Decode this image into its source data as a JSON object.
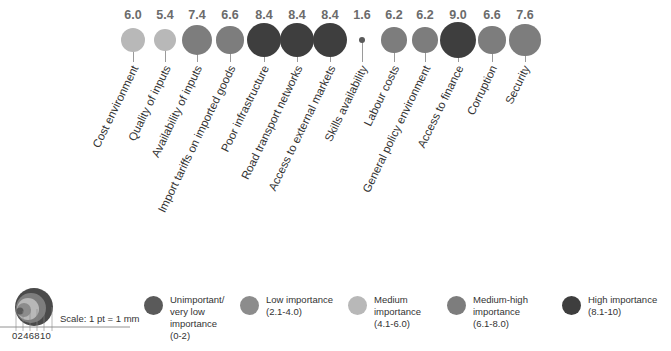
{
  "chart_data": {
    "type": "bubble",
    "title": "",
    "categories": [
      "Cost environment",
      "Quality of inputs",
      "Availability of inputs",
      "Import tariffs on imported goods",
      "Poor infrastructure",
      "Road transport networks",
      "Access to external markets",
      "Skills availability",
      "Labour costs",
      "General policy environment",
      "Access to finance",
      "Corruption",
      "Security"
    ],
    "values": [
      6.0,
      5.4,
      7.4,
      6.6,
      8.4,
      8.4,
      8.4,
      1.6,
      6.2,
      6.2,
      9.0,
      6.6,
      7.6
    ],
    "value_labels": [
      "6.0",
      "5.4",
      "7.4",
      "6.6",
      "8.4",
      "8.4",
      "8.4",
      "1.6",
      "6.2",
      "6.2",
      "9.0",
      "6.6",
      "7.6"
    ],
    "importance_class": [
      "medium",
      "medium",
      "medium-high",
      "medium-high",
      "high",
      "high",
      "high",
      "unimportant",
      "medium-high",
      "medium-high",
      "high",
      "medium-high",
      "medium-high"
    ],
    "legend": [
      {
        "key": "unimportant",
        "label": "Unimportant/\nvery low\nimportance\n(0-2)",
        "color": "#5a5a5a"
      },
      {
        "key": "low",
        "label": "Low importance\n(2.1-4.0)",
        "color": "#8c8c8c"
      },
      {
        "key": "medium",
        "label": "Medium\nimportance\n(4.1-6.0)",
        "color": "#b8b8b8"
      },
      {
        "key": "medium-high",
        "label": "Medium-high\nimportance\n(6.1-8.0)",
        "color": "#7d7d7d"
      },
      {
        "key": "high",
        "label": "High  importance\n(8.1-10)",
        "color": "#3e3e3e"
      }
    ],
    "scale": {
      "label": "Scale: 1 pt = 1 mm",
      "ticks": [
        "0",
        "2",
        "4",
        "6",
        "8",
        "10"
      ]
    },
    "ylim": [
      0,
      10
    ]
  },
  "layout": {
    "x_centers": [
      133,
      165,
      197,
      230,
      264,
      297,
      330,
      362,
      394,
      425,
      458,
      492,
      525
    ],
    "circle_y": 40
  }
}
